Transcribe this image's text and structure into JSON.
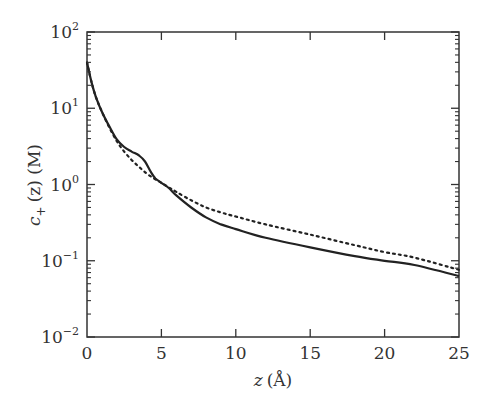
{
  "chart_data": {
    "type": "line",
    "title": "",
    "xlabel": "z (Å)",
    "ylabel": "c+ (z) (M)",
    "xlim": [
      0,
      25
    ],
    "ylim": [
      0.01,
      100
    ],
    "yscale": "log",
    "grid": false,
    "legend": null,
    "x_ticks": [
      "0",
      "5",
      "10",
      "15",
      "20",
      "25"
    ],
    "y_ticks": [
      "10^-2",
      "10^-1",
      "10^0",
      "10^1",
      "10^2"
    ],
    "series": [
      {
        "name": "solid",
        "style": "solid",
        "x": [
          0,
          0.3,
          0.6,
          1,
          1.5,
          2,
          2.5,
          3,
          3.5,
          3.9,
          4.3,
          4.6,
          5,
          5.5,
          6,
          7,
          8,
          9,
          10,
          12,
          15,
          18,
          20,
          22,
          25
        ],
        "y": [
          40,
          22,
          14,
          9,
          5.8,
          3.9,
          3.1,
          2.7,
          2.4,
          2.0,
          1.45,
          1.2,
          1.05,
          0.9,
          0.72,
          0.5,
          0.37,
          0.3,
          0.26,
          0.2,
          0.15,
          0.115,
          0.1,
          0.088,
          0.063
        ]
      },
      {
        "name": "dotted",
        "style": "dotted",
        "x": [
          0,
          0.3,
          0.6,
          1,
          1.5,
          2,
          2.5,
          3,
          3.5,
          4,
          4.5,
          5,
          5.5,
          6,
          7,
          8,
          9,
          10,
          12,
          15,
          18,
          20,
          22,
          25
        ],
        "y": [
          40,
          22,
          14,
          9,
          5.6,
          3.7,
          2.7,
          2.1,
          1.7,
          1.4,
          1.2,
          1.05,
          0.92,
          0.8,
          0.62,
          0.5,
          0.43,
          0.38,
          0.3,
          0.22,
          0.16,
          0.13,
          0.11,
          0.076
        ]
      }
    ]
  },
  "axes": {
    "x_label_var": "z",
    "x_label_unit": "(Å)",
    "y_label_var": "c",
    "y_label_sub": "+",
    "y_label_rest": "(z) (M)",
    "y_tick_base": "10",
    "y_tick_exps": [
      "2",
      "1",
      "0",
      "−1",
      "−2"
    ],
    "x_tick_labels": [
      "0",
      "5",
      "10",
      "15",
      "20",
      "25"
    ]
  }
}
